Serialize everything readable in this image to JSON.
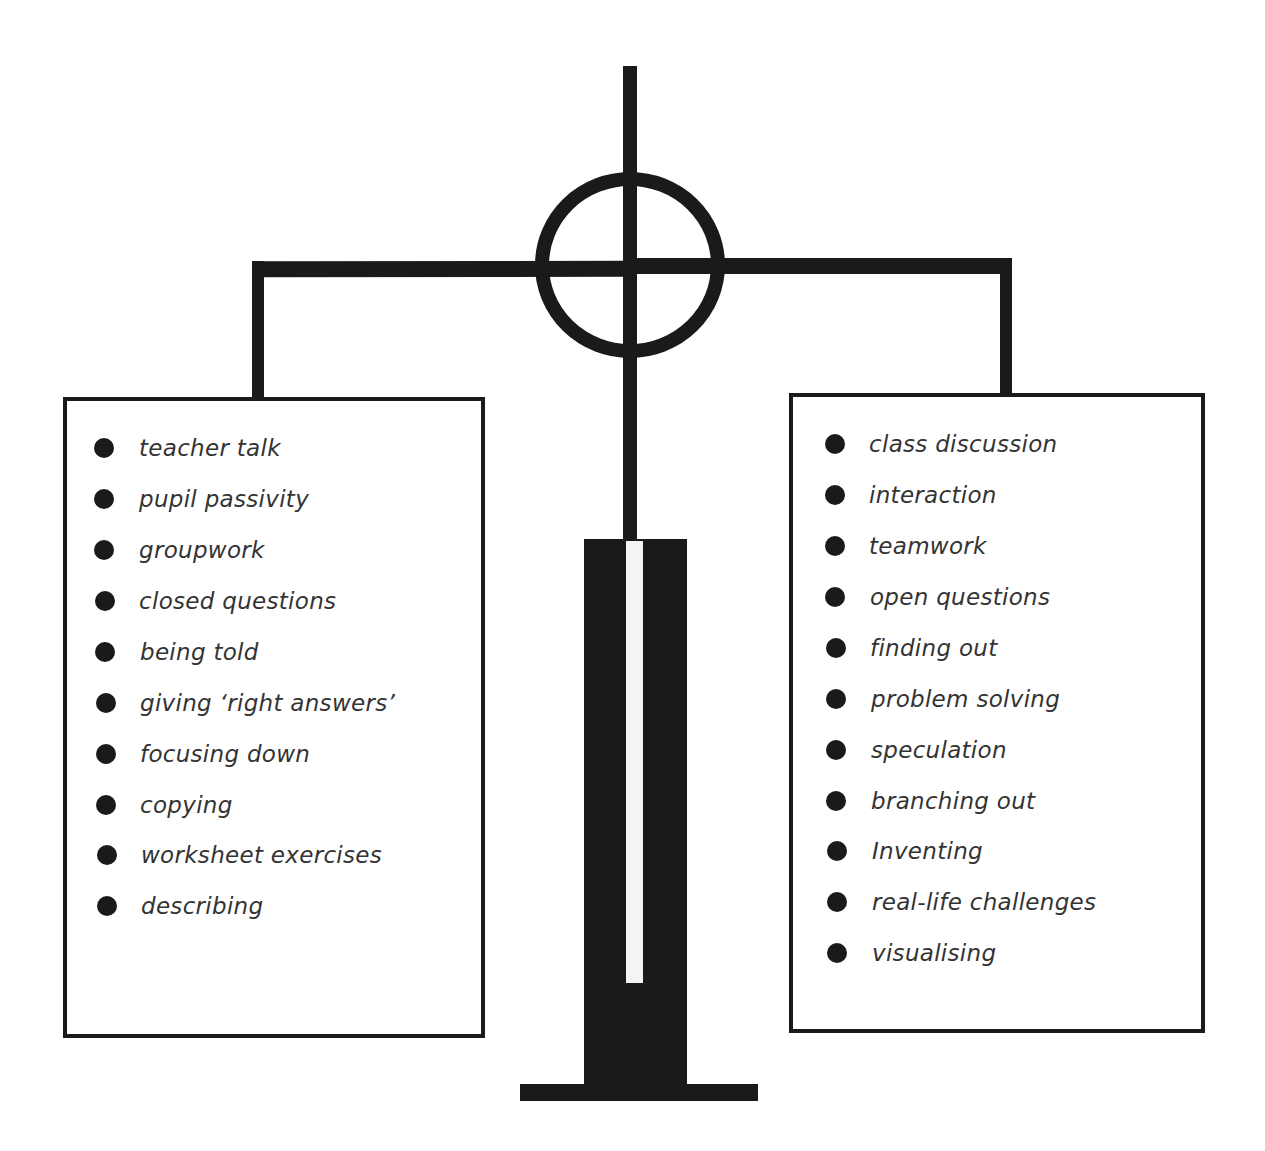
{
  "diagram": {
    "type": "balance-scale",
    "colors": {
      "ink": "#1a1a1a",
      "background": "#ffffff",
      "text": "#333333"
    },
    "left_pan": {
      "items": [
        {
          "label": "teacher talk"
        },
        {
          "label": "pupil passivity"
        },
        {
          "label": "groupwork"
        },
        {
          "label": "closed questions"
        },
        {
          "label": "being told"
        },
        {
          "label": "giving ‘right answers’"
        },
        {
          "label": "focusing down"
        },
        {
          "label": "copying"
        },
        {
          "label": "worksheet exercises"
        },
        {
          "label": "describing"
        }
      ]
    },
    "right_pan": {
      "items": [
        {
          "label": "class discussion"
        },
        {
          "label": "interaction"
        },
        {
          "label": "teamwork"
        },
        {
          "label": "open questions"
        },
        {
          "label": "finding out"
        },
        {
          "label": "problem solving"
        },
        {
          "label": "speculation"
        },
        {
          "label": "branching out"
        },
        {
          "label": "Inventing"
        },
        {
          "label": "real-life challenges"
        },
        {
          "label": "visualising"
        }
      ]
    }
  }
}
